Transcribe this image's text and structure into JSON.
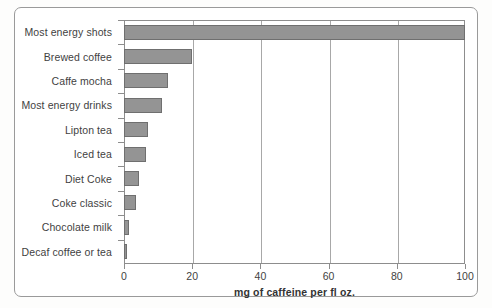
{
  "chart_data": {
    "type": "bar",
    "orientation": "horizontal",
    "title": "",
    "xlabel": "mg of caffeine per fl oz.",
    "ylabel": "",
    "xlim": [
      0,
      100
    ],
    "xticks": [
      0,
      20,
      40,
      60,
      80,
      100
    ],
    "grid": true,
    "legend": false,
    "bar_color": "#949494",
    "bar_edge_color": "#6f6f6f",
    "categories": [
      "Most energy shots",
      "Brewed coffee",
      "Caffe mocha",
      "Most energy drinks",
      "Lipton tea",
      "Iced tea",
      "Diet Coke",
      "Coke classic",
      "Chocolate milk",
      "Decaf coffee or tea"
    ],
    "values": [
      100,
      20,
      13,
      11,
      7,
      6.5,
      4.5,
      3.5,
      1.5,
      1
    ]
  }
}
